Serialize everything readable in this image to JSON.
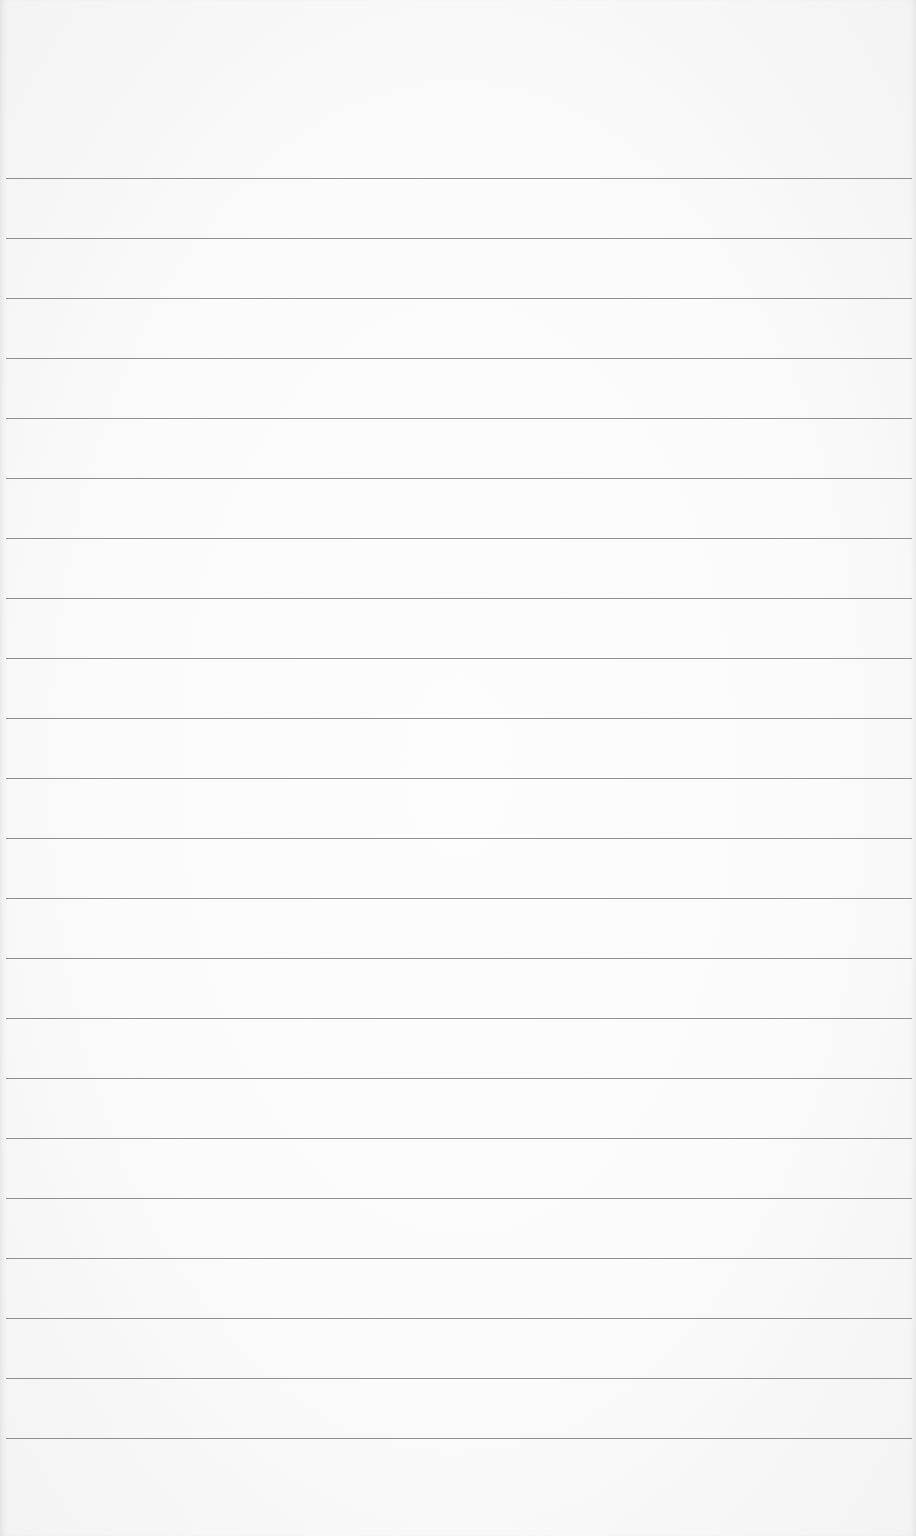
{
  "page": {
    "type": "blank lined paper",
    "background_color": "#fbfbfb",
    "rule_color": "#7d7d7d",
    "rule_count": 22,
    "first_rule_y": 178,
    "rule_spacing": 60
  }
}
